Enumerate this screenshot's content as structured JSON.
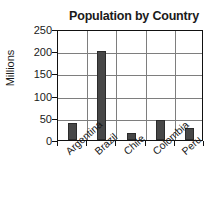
{
  "chart_data": {
    "type": "bar",
    "title": "Population by Country",
    "xlabel": "",
    "ylabel": "Millions",
    "categories": [
      "Argentina",
      "Brazil",
      "Chile",
      "Colombia",
      "Peru"
    ],
    "values": [
      38,
      200,
      15,
      45,
      27
    ],
    "ylim": [
      0,
      250
    ],
    "yticks": [
      0,
      50,
      100,
      150,
      200,
      250
    ],
    "ytick_labels": [
      "0",
      "50",
      "100",
      "150",
      "200",
      "250"
    ],
    "grid": "horizontal-and-vertical",
    "legend": "none",
    "bar_color": "#474747",
    "axis_color": "#111111",
    "grid_color": "#7e7e7e",
    "series": [
      {
        "name": "Population",
        "values": [
          38,
          200,
          15,
          45,
          27
        ]
      }
    ]
  }
}
